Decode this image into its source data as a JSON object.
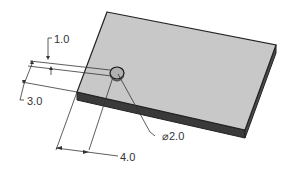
{
  "diagram": {
    "type": "engineering-drawing",
    "colors": {
      "top_face": "#c8c8c8",
      "side_face": "#3a3a3a",
      "edge": "#222222",
      "dimension_line": "#333333",
      "background": "#ffffff"
    },
    "dimensions": [
      {
        "id": "dim-1",
        "label": "1.0",
        "description": "hole offset dimension"
      },
      {
        "id": "dim-3",
        "label": "3.0",
        "description": "hole distance from front edge"
      },
      {
        "id": "dim-4",
        "label": "4.0",
        "description": "hole distance from left edge"
      },
      {
        "id": "dim-dia",
        "label": "⌀2.0",
        "description": "hole diameter"
      }
    ]
  }
}
